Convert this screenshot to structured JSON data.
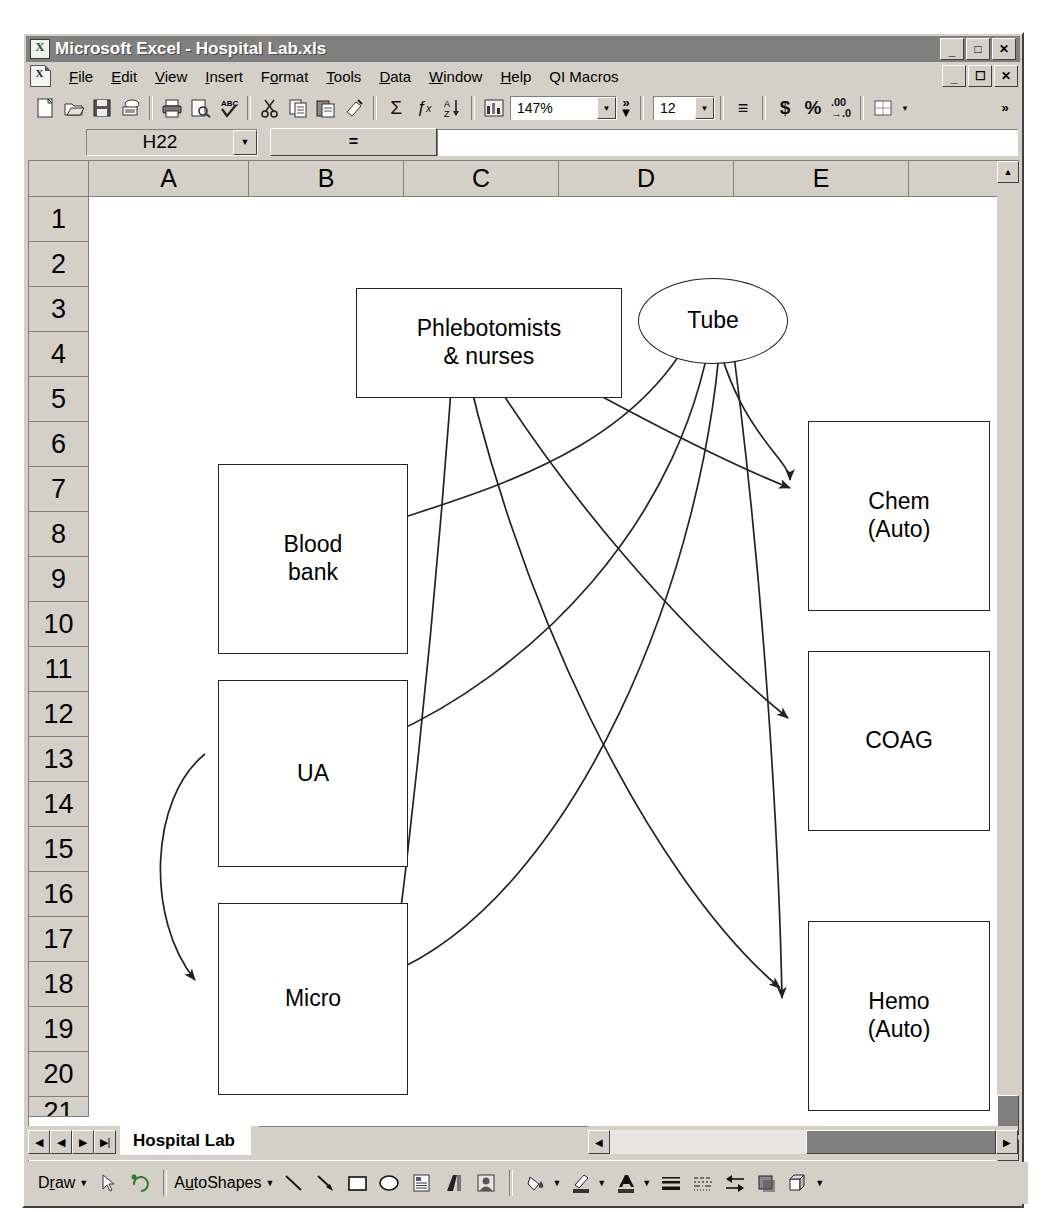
{
  "window": {
    "title": "Microsoft Excel - Hospital Lab.xls",
    "app_icon": "excel-icon",
    "minimize_label": "_",
    "maximize_label": "❐",
    "close_label": "✕",
    "doc_minimize_label": "_",
    "doc_restore_label": "❐",
    "doc_close_label": "✕"
  },
  "menu": {
    "doc_icon": "workbook-icon",
    "items": [
      {
        "label": "File"
      },
      {
        "label": "Edit"
      },
      {
        "label": "View"
      },
      {
        "label": "Insert"
      },
      {
        "label": "Format"
      },
      {
        "label": "Tools"
      },
      {
        "label": "Data"
      },
      {
        "label": "Window"
      },
      {
        "label": "Help"
      },
      {
        "label": "QI Macros"
      }
    ]
  },
  "toolbar": {
    "buttons": [
      {
        "name": "new-icon",
        "glyph": "⬜"
      },
      {
        "name": "open-icon",
        "glyph": "📂"
      },
      {
        "name": "save-icon",
        "glyph": "💾"
      },
      {
        "name": "mail-icon",
        "glyph": "✉"
      },
      {
        "name": "print-icon",
        "glyph": "🖨"
      },
      {
        "name": "print-preview-icon",
        "glyph": "🔍"
      },
      {
        "name": "spelling-icon",
        "glyph": "✓"
      },
      {
        "name": "cut-icon",
        "glyph": "✂"
      },
      {
        "name": "copy-icon",
        "glyph": "⧉"
      },
      {
        "name": "paste-icon",
        "glyph": "📋"
      },
      {
        "name": "format-painter-icon",
        "glyph": "🖌"
      },
      {
        "name": "autosum-icon",
        "glyph": "Σ"
      },
      {
        "name": "paste-function-icon",
        "glyph": "ƒx"
      },
      {
        "name": "sort-ascending-icon",
        "glyph": "A↓"
      },
      {
        "name": "chart-wizard-icon",
        "glyph": "📊"
      }
    ],
    "zoom_value": "147%",
    "zoom_dropdown_icon": "chevron-down-icon",
    "overflow_icon": "toolbar-overflow-icon",
    "overflow_label": "»",
    "font_size_value": "12",
    "font_size_dropdown_icon": "chevron-down-icon",
    "format_buttons": [
      {
        "name": "align-icon",
        "glyph": "≡"
      },
      {
        "name": "currency-icon",
        "glyph": "$"
      },
      {
        "name": "percent-icon",
        "glyph": "%"
      },
      {
        "name": "decimal-icon",
        "glyph": ".00"
      }
    ],
    "borders_icon": "borders-icon",
    "borders_dropdown_icon": "chevron-down-icon"
  },
  "formula_bar": {
    "name_box_value": "H22",
    "name_box_dropdown_icon": "chevron-down-icon",
    "equals_label": "=",
    "formula_value": ""
  },
  "grid": {
    "columns": [
      "A",
      "B",
      "C",
      "D",
      "E"
    ],
    "rows": [
      "1",
      "2",
      "3",
      "4",
      "5",
      "6",
      "7",
      "8",
      "9",
      "10",
      "11",
      "12",
      "13",
      "14",
      "15",
      "16",
      "17",
      "18",
      "19",
      "20",
      "21"
    ],
    "scroll_up_icon": "scroll-up-icon",
    "scroll_down_icon": "scroll-down-icon"
  },
  "diagram": {
    "nodes": [
      {
        "id": "phlebotomists",
        "label": "Phlebotomists\n& nurses",
        "shape": "rect"
      },
      {
        "id": "tube",
        "label": "Tube",
        "shape": "ellipse"
      },
      {
        "id": "blood-bank",
        "label": "Blood\nbank",
        "shape": "rect"
      },
      {
        "id": "ua",
        "label": "UA",
        "shape": "rect"
      },
      {
        "id": "micro",
        "label": "Micro",
        "shape": "rect"
      },
      {
        "id": "chem-auto",
        "label": "Chem\n(Auto)",
        "shape": "rect"
      },
      {
        "id": "coag",
        "label": "COAG",
        "shape": "rect"
      },
      {
        "id": "hemo-auto",
        "label": "Hemo\n(Auto)",
        "shape": "rect"
      }
    ],
    "edges": [
      {
        "from": "phlebotomists",
        "to": "chem-auto"
      },
      {
        "from": "phlebotomists",
        "to": "coag"
      },
      {
        "from": "phlebotomists",
        "to": "hemo-auto"
      },
      {
        "from": "phlebotomists",
        "to": "micro"
      },
      {
        "from": "tube",
        "to": "blood-bank"
      },
      {
        "from": "tube",
        "to": "ua"
      },
      {
        "from": "tube",
        "to": "micro"
      },
      {
        "from": "tube",
        "to": "hemo-auto"
      },
      {
        "from": "ua",
        "to": "micro"
      }
    ]
  },
  "sheet_tabs": {
    "first_icon": "first-sheet-icon",
    "prev_icon": "prev-sheet-icon",
    "next_icon": "next-sheet-icon",
    "last_icon": "last-sheet-icon",
    "tabs": [
      {
        "label": "Hospital Lab",
        "active": true
      }
    ],
    "hscroll_left_icon": "scroll-left-icon",
    "hscroll_right_icon": "scroll-right-icon"
  },
  "drawing_toolbar": {
    "draw_label": "Draw",
    "draw_dropdown_icon": "chevron-down-icon",
    "select_icon": "select-arrow-icon",
    "rotate_icon": "free-rotate-icon",
    "autoshapes_label": "AutoShapes",
    "autoshapes_dropdown_icon": "chevron-down-icon",
    "tools": [
      {
        "name": "line-icon",
        "glyph": "╲"
      },
      {
        "name": "arrow-icon",
        "glyph": "↘"
      },
      {
        "name": "rectangle-icon",
        "glyph": "▭"
      },
      {
        "name": "oval-icon",
        "glyph": "◯"
      },
      {
        "name": "text-box-icon",
        "glyph": "▤"
      },
      {
        "name": "wordart-icon",
        "glyph": "A"
      },
      {
        "name": "clip-art-icon",
        "glyph": "🖼"
      },
      {
        "name": "fill-color-icon",
        "glyph": "🪣"
      },
      {
        "name": "line-color-icon",
        "glyph": "✎"
      },
      {
        "name": "font-color-icon",
        "glyph": "A"
      },
      {
        "name": "line-style-icon",
        "glyph": "≡"
      },
      {
        "name": "dash-style-icon",
        "glyph": "┅"
      },
      {
        "name": "arrow-style-icon",
        "glyph": "⇄"
      },
      {
        "name": "shadow-icon",
        "glyph": "■"
      },
      {
        "name": "3d-icon",
        "glyph": "▢"
      }
    ],
    "final_dropdown_icon": "chevron-down-icon"
  }
}
